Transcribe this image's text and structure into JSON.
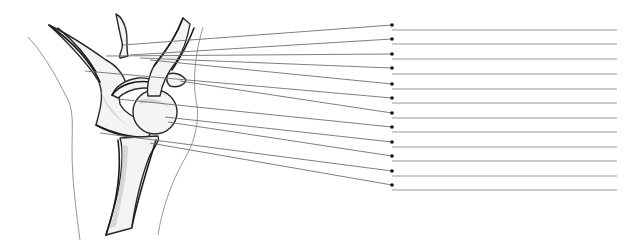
{
  "diagram": {
    "colors": {
      "leader_line": "#707070",
      "answer_line": "#9a9a9a",
      "dot": "#111111",
      "bone_outline": "#2a2a2a",
      "body_outline": "#8a8a8a"
    },
    "answer_line_x_end": 617,
    "labels": [
      {
        "index": 1,
        "start": [
          123,
          45
        ],
        "dot": [
          392,
          25
        ],
        "answer_y": 30,
        "text": ""
      },
      {
        "index": 2,
        "start": [
          130,
          55
        ],
        "dot": [
          392,
          39
        ],
        "answer_y": 44,
        "text": ""
      },
      {
        "index": 3,
        "start": [
          106,
          56
        ],
        "dot": [
          392,
          54
        ],
        "answer_y": 59,
        "text": ""
      },
      {
        "index": 4,
        "start": [
          140,
          58
        ],
        "dot": [
          392,
          68
        ],
        "answer_y": 74,
        "text": ""
      },
      {
        "index": 5,
        "start": [
          150,
          60
        ],
        "dot": [
          392,
          84
        ],
        "answer_y": 89,
        "text": ""
      },
      {
        "index": 6,
        "start": [
          85,
          71
        ],
        "dot": [
          392,
          98
        ],
        "answer_y": 103,
        "text": ""
      },
      {
        "index": 7,
        "start": [
          180,
          81
        ],
        "dot": [
          392,
          113
        ],
        "answer_y": 118,
        "text": ""
      },
      {
        "index": 8,
        "start": [
          118,
          99
        ],
        "dot": [
          392,
          127
        ],
        "answer_y": 132,
        "text": ""
      },
      {
        "index": 9,
        "start": [
          165,
          117
        ],
        "dot": [
          392,
          142
        ],
        "answer_y": 147,
        "text": ""
      },
      {
        "index": 10,
        "start": [
          168,
          122
        ],
        "dot": [
          392,
          156
        ],
        "answer_y": 161,
        "text": ""
      },
      {
        "index": 11,
        "start": [
          100,
          133
        ],
        "dot": [
          392,
          171
        ],
        "answer_y": 176,
        "text": ""
      },
      {
        "index": 12,
        "start": [
          150,
          143
        ],
        "dot": [
          392,
          185
        ],
        "answer_y": 190,
        "text": ""
      }
    ]
  }
}
